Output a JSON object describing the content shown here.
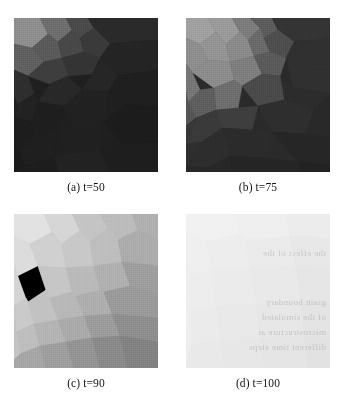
{
  "figure": {
    "type": "image-grid",
    "rows": 2,
    "cols": 2,
    "background_color": "#ffffff"
  },
  "panels": [
    {
      "id": "panel-a",
      "caption": "(a) t=50",
      "label": "(a)",
      "time_value": "t=50",
      "mean_gray": "#232323",
      "brightness_percent": 14,
      "notes": "very dark overall; cluster of brighter polygonal grains in upper-left corner; faint vertical scan line near right edge",
      "base_color": "#1f1f1f",
      "grains": [
        {
          "points": "0,0 26,0 34,16 18,30 0,26",
          "fill": "#8e8e8e"
        },
        {
          "points": "26,0 52,0 58,12 44,24 34,16",
          "fill": "#6e6e6e"
        },
        {
          "points": "52,0 74,0 80,10 66,20 58,12",
          "fill": "#4a4a4a"
        },
        {
          "points": "74,0 144,0 144,22 96,26 80,10",
          "fill": "#2a2a2a"
        },
        {
          "points": "0,26 18,30 30,44 14,58 0,52",
          "fill": "#606060"
        },
        {
          "points": "18,30 34,16 44,24 48,40 30,44",
          "fill": "#5a5a5a"
        },
        {
          "points": "44,24 58,12 66,20 70,34 48,40",
          "fill": "#484848"
        },
        {
          "points": "66,20 80,10 96,26 86,40 70,34",
          "fill": "#3a3a3a"
        },
        {
          "points": "48,40 70,34 86,40 78,56 54,58",
          "fill": "#343434"
        },
        {
          "points": "30,44 48,40 54,58 36,66 14,58",
          "fill": "#3e3e3e"
        },
        {
          "points": "0,52 14,58 20,76 4,86 0,78",
          "fill": "#2e2e2e"
        },
        {
          "points": "86,40 96,26 144,22 144,52 104,58",
          "fill": "#242424"
        },
        {
          "points": "78,56 86,40 104,58 94,74 68,72",
          "fill": "#262626"
        },
        {
          "points": "36,66 54,58 68,72 50,88 24,84",
          "fill": "#282828"
        },
        {
          "points": "4,86 20,76 24,84 18,104 0,100",
          "fill": "#222222"
        },
        {
          "points": "104,58 144,52 144,90 112,86 94,74",
          "fill": "#1f1f1f"
        },
        {
          "points": "50,88 68,72 94,74 90,104 58,108",
          "fill": "#212121"
        },
        {
          "points": "18,104 24,84 50,88 44,112 20,118",
          "fill": "#1e1e1e"
        },
        {
          "points": "0,100 18,104 20,118 6,134 0,128",
          "fill": "#1d1d1d"
        },
        {
          "points": "90,104 112,86 144,90 144,124 108,126",
          "fill": "#1c1c1c"
        },
        {
          "points": "44,112 58,108 90,104 86,132 52,136",
          "fill": "#202020"
        },
        {
          "points": "6,134 20,118 44,112 40,140 10,148",
          "fill": "#1f1f1f"
        },
        {
          "points": "0,128 6,134 10,148 0,154",
          "fill": "#1b1b1b"
        },
        {
          "points": "86,132 108,126 144,124 144,154 96,154",
          "fill": "#1e1e1e"
        },
        {
          "points": "40,140 52,136 86,132 96,154 44,154",
          "fill": "#222222"
        },
        {
          "points": "10,148 40,140 44,154 8,154",
          "fill": "#1d1d1d"
        }
      ]
    },
    {
      "id": "panel-b",
      "caption": "(b) t=75",
      "label": "(b)",
      "time_value": "t=75",
      "mean_gray": "#3a3a3a",
      "brightness_percent": 25,
      "notes": "dark lower-right half; broad diagonal band of mid-to-light polygonal grains sweeping from upper-left to centre",
      "base_color": "#2a2a2a",
      "grains": [
        {
          "points": "0,0 22,0 30,14 14,26 0,20",
          "fill": "#a0a0a0"
        },
        {
          "points": "22,0 46,0 54,14 40,26 30,14",
          "fill": "#9a9a9a"
        },
        {
          "points": "46,0 64,0 74,10 62,22 54,14",
          "fill": "#7c7c7c"
        },
        {
          "points": "64,0 86,0 92,12 78,20 74,10",
          "fill": "#5c5c5c"
        },
        {
          "points": "86,0 144,0 144,20 108,24 92,12",
          "fill": "#343434"
        },
        {
          "points": "0,20 14,26 22,42 6,54 0,46",
          "fill": "#8e8e8e"
        },
        {
          "points": "14,26 30,14 40,26 44,44 22,42",
          "fill": "#949494"
        },
        {
          "points": "40,26 54,14 62,22 68,38 44,44",
          "fill": "#8a8a8a"
        },
        {
          "points": "62,22 74,10 78,20 84,34 68,38",
          "fill": "#6a6a6a"
        },
        {
          "points": "78,20 92,12 108,24 100,40 84,34",
          "fill": "#4e4e4e"
        },
        {
          "points": "108,24 144,20 144,52 112,50 100,40",
          "fill": "#303030"
        },
        {
          "points": "0,46 6,54 14,72 2,84 0,74",
          "fill": "#767676"
        },
        {
          "points": "22,42 44,44 48,62 28,70 6,54",
          "fill": "#8c8c8c"
        },
        {
          "points": "44,44 68,38 76,56 56,68 48,62",
          "fill": "#7e7e7e"
        },
        {
          "points": "68,38 84,34 100,40 94,58 76,56",
          "fill": "#5a5a5a"
        },
        {
          "points": "100,40 112,50 144,52 144,76 108,70",
          "fill": "#303030"
        },
        {
          "points": "94,58 108,70 144,76 128,92 98,82",
          "fill": "#2c2c2c"
        },
        {
          "points": "76,56 94,58 98,82 72,88 56,68",
          "fill": "#4a4a4a"
        },
        {
          "points": "28,70 48,62 56,68 52,90 30,92",
          "fill": "#6e6e6e"
        },
        {
          "points": "2,84 14,72 28,70 30,92 10,100",
          "fill": "#5e5e5e"
        },
        {
          "points": "0,74 2,84 10,100 0,108",
          "fill": "#555555"
        },
        {
          "points": "30,92 52,90 72,88 66,112 36,110",
          "fill": "#3e3e3e"
        },
        {
          "points": "72,88 98,82 128,92 120,116 86,114",
          "fill": "#2e2e2e"
        },
        {
          "points": "128,92 144,76 144,120 120,116",
          "fill": "#292929"
        },
        {
          "points": "10,100 30,92 36,110 16,124 0,126",
          "fill": "#3a3a3a"
        },
        {
          "points": "0,108 10,100 0,126",
          "fill": "#383838"
        },
        {
          "points": "36,110 66,112 86,114 80,140 44,138",
          "fill": "#2b2b2b"
        },
        {
          "points": "86,114 120,116 144,120 144,148 112,144",
          "fill": "#262626"
        },
        {
          "points": "16,124 36,110 44,138 22,150 0,148",
          "fill": "#2d2d2d"
        },
        {
          "points": "0,126 16,124 0,148",
          "fill": "#2e2e2e"
        },
        {
          "points": "44,138 80,140 112,144 116,154 46,154",
          "fill": "#252525"
        },
        {
          "points": "112,144 144,148 144,154 116,154",
          "fill": "#222222"
        },
        {
          "points": "22,150 44,138 46,154 20,154",
          "fill": "#272727"
        },
        {
          "points": "0,148 22,150 20,154 0,154",
          "fill": "#282828"
        }
      ]
    },
    {
      "id": "panel-c",
      "caption": "(c) t=90",
      "label": "(c)",
      "time_value": "t=90",
      "mean_gray": "#aeaeae",
      "brightness_percent": 68,
      "notes": "light overall; large coarse polygonal grains, brightest in upper-left, progressively darker toward lower-right corner",
      "base_color": "#b4b4b4",
      "grains": [
        {
          "points": "0,0 30,0 38,18 16,30 0,22",
          "fill": "#e2e2e2"
        },
        {
          "points": "30,0 58,0 66,16 48,30 38,18",
          "fill": "#d6d6d6"
        },
        {
          "points": "58,0 86,0 94,14 76,28 66,16",
          "fill": "#c4c4c4"
        },
        {
          "points": "86,0 118,0 124,16 104,26 94,14",
          "fill": "#bcbcbc"
        },
        {
          "points": "118,0 144,0 144,26 124,16",
          "fill": "#b0b0b0"
        },
        {
          "points": "0,22 16,30 24,52 4,62 0,50",
          "fill": "#dcdcdc"
        },
        {
          "points": "16,30 38,18 48,30 52,54 24,52",
          "fill": "#d0d0d0"
        },
        {
          "points": "48,30 66,16 76,28 80,52 52,54",
          "fill": "#c8c8c8"
        },
        {
          "points": "76,28 94,14 104,26 108,48 80,52",
          "fill": "#bebebe"
        },
        {
          "points": "104,26 124,16 144,26 144,52 108,48",
          "fill": "#acacac"
        },
        {
          "points": "0,50 4,62 12,84 0,92",
          "fill": "#d4d4d4"
        },
        {
          "points": "4,62 24,52 32,76 14,88 12,84",
          "fill": "#cececе"
        },
        {
          "points": "24,52 52,54 58,78 36,84 32,76",
          "fill": "#c6c6c6"
        },
        {
          "points": "52,54 80,52 86,76 62,82 58,78",
          "fill": "#bababa"
        },
        {
          "points": "80,52 108,48 116,72 90,78 86,76",
          "fill": "#b0b0b0"
        },
        {
          "points": "108,48 144,52 144,80 116,72",
          "fill": "#9e9e9e"
        },
        {
          "points": "0,92 12,84 14,88 20,110 2,118",
          "fill": "#cacaca"
        },
        {
          "points": "14,88 32,76 36,84 44,106 20,110",
          "fill": "#c2c2c2"
        },
        {
          "points": "36,84 58,78 62,82 70,102 44,106",
          "fill": "#b8b8b8"
        },
        {
          "points": "62,82 86,76 90,78 98,100 70,102",
          "fill": "#aeaeae"
        },
        {
          "points": "90,78 116,72 144,80 144,104 98,100",
          "fill": "#9a9a9a"
        },
        {
          "points": "2,118 20,110 26,132 6,140",
          "fill": "#bebebe"
        },
        {
          "points": "20,110 44,106 52,128 26,132",
          "fill": "#b4b4b4"
        },
        {
          "points": "44,106 70,102 78,124 52,128",
          "fill": "#aaaaaa"
        },
        {
          "points": "70,102 98,100 106,122 78,124",
          "fill": "#9c9c9c"
        },
        {
          "points": "98,100 144,104 144,128 106,122",
          "fill": "#8e8e8e"
        },
        {
          "points": "0,92 2,118 6,140 0,146",
          "fill": "#c4c4c4"
        },
        {
          "points": "6,140 26,132 32,154 0,154 0,146",
          "fill": "#a6a6a6"
        },
        {
          "points": "26,132 52,128 60,154 32,154",
          "fill": "#9e9e9e"
        },
        {
          "points": "52,128 78,124 86,154 60,154",
          "fill": "#949494"
        },
        {
          "points": "78,124 106,122 114,154 86,154",
          "fill": "#8a8a8a"
        },
        {
          "points": "106,122 144,128 144,154 114,154",
          "fill": "#828282"
        }
      ]
    },
    {
      "id": "panel-d",
      "caption": "(d) t=100",
      "label": "(d)",
      "time_value": "t=100",
      "mean_gray": "#ececec",
      "brightness_percent": 93,
      "notes": "almost uniform very light gray; grain contrast nearly vanished; faint mirrored show-through text from the reverse printed page",
      "base_color": "#ededed",
      "grains": [
        {
          "points": "0,0 48,0 54,20 20,28 0,18",
          "fill": "#f1f1f1"
        },
        {
          "points": "48,0 100,0 104,22 60,26 54,20",
          "fill": "#efefef"
        },
        {
          "points": "100,0 144,0 144,24 104,22",
          "fill": "#ececec"
        },
        {
          "points": "0,18 20,28 26,56 2,62",
          "fill": "#efefef"
        },
        {
          "points": "20,28 54,20 60,26 64,54 26,56",
          "fill": "#ededed"
        },
        {
          "points": "60,26 104,22 110,52 64,54",
          "fill": "#ebebeb"
        },
        {
          "points": "104,22 144,24 144,56 110,52",
          "fill": "#e8e8e8"
        },
        {
          "points": "2,62 26,56 30,92 4,96",
          "fill": "#ededed"
        },
        {
          "points": "26,56 64,54 70,90 30,92",
          "fill": "#ebebeb"
        },
        {
          "points": "64,54 110,52 114,88 70,90",
          "fill": "#e9e9e9"
        },
        {
          "points": "110,52 144,56 144,90 114,88",
          "fill": "#e6e6e6"
        },
        {
          "points": "4,96 30,92 34,126 6,130",
          "fill": "#ebebeb"
        },
        {
          "points": "30,92 70,90 74,124 34,126",
          "fill": "#e9e9e9"
        },
        {
          "points": "70,90 114,88 118,122 74,124",
          "fill": "#e7e7e7"
        },
        {
          "points": "114,88 144,90 144,124 118,122",
          "fill": "#e4e4e4"
        },
        {
          "points": "0,18 2,62 4,96 6,130 0,154 0,130",
          "fill": "#eeeeee"
        },
        {
          "points": "6,130 34,126 38,154 0,154",
          "fill": "#e9e9e9"
        },
        {
          "points": "34,126 74,124 78,154 38,154",
          "fill": "#e7e7e7"
        },
        {
          "points": "74,124 118,122 122,154 78,154",
          "fill": "#e5e5e5"
        },
        {
          "points": "118,122 144,124 144,154 122,154",
          "fill": "#e2e2e2"
        }
      ],
      "showthrough_lines": [
        "the effect of the",
        "grain boundary",
        "of the simulated",
        "microstructure at",
        "different time steps"
      ]
    }
  ]
}
